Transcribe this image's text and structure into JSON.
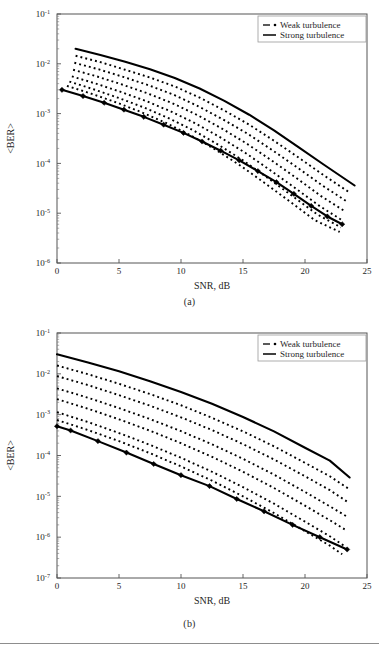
{
  "figure": {
    "footer_rule": true,
    "panels": [
      {
        "id": "a",
        "caption": "(a)"
      },
      {
        "id": "b",
        "caption": "(b)"
      }
    ]
  },
  "legend": {
    "weak_label": "Weak turbulence",
    "strong_label": "Strong turbulence",
    "weak_style": "dash-dot",
    "strong_style": "solid"
  },
  "axis": {
    "xlabel": "SNR, dB",
    "ylabel": "<BER>",
    "xticks": [
      "0",
      "5",
      "10",
      "15",
      "20",
      "25"
    ]
  },
  "chart_data": [
    {
      "type": "line",
      "panel": "a",
      "title": "",
      "xlabel": "SNR, dB",
      "ylabel": "<BER>",
      "xlim": [
        0,
        25
      ],
      "ylim": [
        1e-06,
        0.1
      ],
      "yscale": "log",
      "xticks": [
        0,
        5,
        10,
        15,
        20,
        25
      ],
      "yticks": [
        0.1,
        0.01,
        0.001,
        0.0001,
        1e-05,
        1e-06
      ],
      "ytick_labels": [
        "10-1",
        "10-2",
        "10-3",
        "10-4",
        "10-5",
        "10-6"
      ],
      "grid": false,
      "legend_position": "top-right",
      "series": [
        {
          "name": "Strong turbulence (upper bound)",
          "style": "solid",
          "markers": false,
          "x": [
            1.5,
            3.5,
            5.5,
            7.5,
            9.5,
            11.5,
            13.5,
            15.5,
            17.5,
            19.5,
            21.5,
            24.0
          ],
          "values": [
            0.02,
            0.015,
            0.011,
            0.0078,
            0.0052,
            0.0032,
            0.0018,
            0.00095,
            0.00046,
            0.00021,
            9.5e-05,
            3.6e-05
          ]
        },
        {
          "name": "Weak turbulence 6",
          "style": "dotted",
          "markers": false,
          "x": [
            1.5,
            3.5,
            5.5,
            7.5,
            9.5,
            11.5,
            13.5,
            15.5,
            17.5,
            19.5,
            21.5,
            23.6
          ],
          "values": [
            0.0145,
            0.0108,
            0.0076,
            0.0053,
            0.0035,
            0.0021,
            0.00115,
            0.0006,
            0.000285,
            0.00013,
            5.8e-05,
            2.6e-05
          ]
        },
        {
          "name": "Weak turbulence 5",
          "style": "dotted",
          "markers": false,
          "x": [
            1.4,
            3.4,
            5.4,
            7.4,
            9.4,
            11.4,
            13.4,
            15.4,
            17.4,
            19.4,
            21.4,
            23.4
          ],
          "values": [
            0.0105,
            0.0077,
            0.0054,
            0.0037,
            0.0024,
            0.0014,
            0.00076,
            0.00039,
            0.000182,
            8.2e-05,
            3.6e-05,
            1.7e-05
          ]
        },
        {
          "name": "Weak turbulence 4",
          "style": "dotted",
          "markers": false,
          "x": [
            1.3,
            3.3,
            5.3,
            7.3,
            9.3,
            11.3,
            13.3,
            15.3,
            17.3,
            19.3,
            21.3,
            23.2
          ],
          "values": [
            0.0076,
            0.0055,
            0.0038,
            0.00255,
            0.00162,
            0.00094,
            0.0005,
            0.00025,
            0.000115,
            5.1e-05,
            2.2e-05,
            1.1e-05
          ]
        },
        {
          "name": "Weak turbulence 3",
          "style": "dotted",
          "markers": false,
          "x": [
            1.2,
            3.2,
            5.2,
            7.2,
            9.2,
            11.2,
            13.2,
            15.2,
            17.2,
            19.2,
            21.2,
            23.0
          ],
          "values": [
            0.0056,
            0.00395,
            0.0027,
            0.00178,
            0.0011,
            0.00063,
            0.00033,
            0.000162,
            7.3e-05,
            3.2e-05,
            1.38e-05,
            7.2e-06
          ]
        },
        {
          "name": "Weak turbulence 2",
          "style": "dotted",
          "markers": false,
          "x": [
            1.0,
            3.0,
            5.0,
            7.0,
            9.0,
            11.0,
            13.0,
            15.0,
            17.0,
            19.0,
            21.0,
            22.9
          ],
          "values": [
            0.0044,
            0.00305,
            0.00205,
            0.00133,
            0.00081,
            0.00046,
            0.000238,
            0.000115,
            5.1e-05,
            2.2e-05,
            9.4e-06,
            5.2e-06
          ]
        },
        {
          "name": "Weak turbulence 1",
          "style": "dotted",
          "markers": false,
          "x": [
            0.8,
            2.8,
            4.8,
            6.8,
            8.8,
            10.8,
            12.8,
            14.8,
            16.8,
            18.8,
            20.8,
            22.8
          ],
          "values": [
            0.0036,
            0.0025,
            0.00167,
            0.00107,
            0.00065,
            0.000365,
            0.000188,
            9e-05,
            3.95e-05,
            1.7e-05,
            7.2e-06,
            4.2e-06
          ]
        },
        {
          "name": "Strong turbulence (lower bound)",
          "style": "solid",
          "markers": true,
          "x": [
            0.4,
            2.1,
            3.8,
            5.4,
            7.0,
            8.6,
            10.2,
            11.7,
            13.2,
            14.7,
            16.2,
            17.7,
            19.1,
            20.5,
            21.8,
            23.0
          ],
          "values": [
            0.003,
            0.00225,
            0.00165,
            0.0012,
            0.00086,
            0.0006,
            0.00041,
            0.000275,
            0.00018,
            0.000115,
            7e-05,
            4.2e-05,
            2.45e-05,
            1.4e-05,
            8.6e-06,
            6e-06
          ]
        }
      ]
    },
    {
      "type": "line",
      "panel": "b",
      "title": "",
      "xlabel": "SNR, dB",
      "ylabel": "<BER>",
      "xlim": [
        0,
        25
      ],
      "ylim": [
        1e-07,
        0.1
      ],
      "yscale": "log",
      "xticks": [
        0,
        5,
        10,
        15,
        20,
        25
      ],
      "yticks": [
        0.1,
        0.01,
        0.001,
        0.0001,
        1e-05,
        1e-06,
        1e-07
      ],
      "ytick_labels": [
        "10-1",
        "10-2",
        "10-3",
        "10-4",
        "10-5",
        "10-6",
        "10-7"
      ],
      "grid": false,
      "legend_position": "top-right",
      "series": [
        {
          "name": "Strong turbulence (upper bound)",
          "style": "solid",
          "markers": false,
          "x": [
            0.0,
            2.5,
            5.0,
            7.5,
            10.0,
            12.5,
            15.0,
            17.5,
            20.0,
            22.0,
            23.6
          ],
          "values": [
            0.03,
            0.019,
            0.0115,
            0.0066,
            0.0036,
            0.00185,
            0.00088,
            0.00039,
            0.000155,
            7.5e-05,
            2.9e-05
          ]
        },
        {
          "name": "Weak turbulence 6",
          "style": "dotted",
          "markers": false,
          "x": [
            0.0,
            2.5,
            5.0,
            7.5,
            10.0,
            12.5,
            15.0,
            17.5,
            20.0,
            22.0,
            23.5
          ],
          "values": [
            0.016,
            0.0098,
            0.0057,
            0.0032,
            0.0017,
            0.00084,
            0.00039,
            0.000168,
            6.6e-05,
            3.1e-05,
            1.55e-05
          ]
        },
        {
          "name": "Weak turbulence 5",
          "style": "dotted",
          "markers": false,
          "x": [
            0.0,
            2.5,
            5.0,
            7.5,
            10.0,
            12.5,
            15.0,
            17.5,
            20.0,
            22.0,
            23.4
          ],
          "values": [
            0.0088,
            0.0053,
            0.003,
            0.00166,
            0.00086,
            0.00042,
            0.00019,
            8e-05,
            3.1e-05,
            1.42e-05,
            7.4e-06
          ]
        },
        {
          "name": "Weak turbulence 4",
          "style": "dotted",
          "markers": false,
          "x": [
            0.0,
            2.5,
            5.0,
            7.5,
            10.0,
            12.5,
            15.0,
            17.5,
            20.0,
            22.0,
            23.3
          ],
          "values": [
            0.0044,
            0.0026,
            0.00145,
            0.00078,
            0.000395,
            0.000188,
            8.3e-05,
            3.4e-05,
            1.28e-05,
            5.7e-06,
            3.3e-06
          ]
        },
        {
          "name": "Weak turbulence 3",
          "style": "dotted",
          "markers": false,
          "x": [
            0.0,
            2.5,
            5.0,
            7.5,
            10.0,
            12.5,
            15.0,
            17.5,
            20.0,
            22.0,
            23.2
          ],
          "values": [
            0.0024,
            0.0014,
            0.00077,
            0.000405,
            0.0002,
            9.3e-05,
            4e-05,
            1.6e-05,
            5.9e-06,
            2.6e-06,
            1.55e-06
          ]
        },
        {
          "name": "Weak turbulence 2",
          "style": "dotted",
          "markers": false,
          "x": [
            0.0,
            2.5,
            5.0,
            7.5,
            10.0,
            12.5,
            15.0,
            17.5,
            20.0,
            22.0,
            23.1
          ],
          "values": [
            0.00115,
            0.00066,
            0.000355,
            0.000182,
            8.8e-05,
            4e-05,
            1.68e-05,
            6.6e-06,
            2.4e-06,
            1.05e-06,
            6.3e-07
          ]
        },
        {
          "name": "Weak turbulence 1",
          "style": "dotted",
          "markers": false,
          "x": [
            0.0,
            2.5,
            5.0,
            7.5,
            10.0,
            12.5,
            15.0,
            17.5,
            20.0,
            22.0,
            23.0
          ],
          "values": [
            0.00074,
            0.00042,
            0.000225,
            0.000114,
            5.4e-05,
            2.42e-05,
            1e-05,
            3.9e-06,
            1.4e-06,
            6.2e-07,
            3.8e-07
          ]
        },
        {
          "name": "Strong turbulence (lower bound)",
          "style": "solid",
          "markers": true,
          "x": [
            0.0,
            1.1,
            3.3,
            5.6,
            7.8,
            10.0,
            12.3,
            14.5,
            16.7,
            19.0,
            21.2,
            23.4
          ],
          "values": [
            0.00052,
            0.00041,
            0.000225,
            0.000118,
            6.2e-05,
            3.3e-05,
            1.78e-05,
            8.6e-06,
            4.3e-06,
            2e-06,
            1e-06,
            5e-07
          ]
        }
      ]
    }
  ]
}
